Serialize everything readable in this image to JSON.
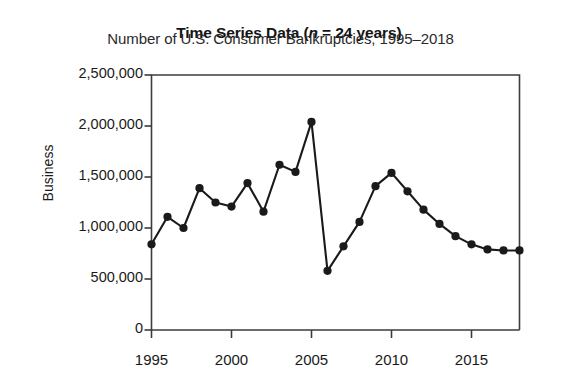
{
  "chart_data": {
    "type": "line",
    "title": "Time Series Data (n = 24 years)",
    "title_prefix": "Time Series Data (",
    "title_italic": "n",
    "title_suffix": " = 24 years)",
    "subtitle": "Number of U.S. Consumer Bankruptcies, 1995–2018",
    "xlabel": "",
    "ylabel": "Business",
    "x": [
      1995,
      1996,
      1997,
      1998,
      1999,
      2000,
      2001,
      2002,
      2003,
      2004,
      2005,
      2006,
      2007,
      2008,
      2009,
      2010,
      2011,
      2012,
      2013,
      2014,
      2015,
      2016,
      2017,
      2018
    ],
    "values": [
      840000,
      1110000,
      1000000,
      1390000,
      1250000,
      1210000,
      1440000,
      1160000,
      1620000,
      1550000,
      2040000,
      580000,
      820000,
      1060000,
      1410000,
      1540000,
      1360000,
      1180000,
      1040000,
      920000,
      840000,
      790000,
      780000,
      780000
    ],
    "categories": [
      "1995",
      "1996",
      "1997",
      "1998",
      "1999",
      "2000",
      "2001",
      "2002",
      "2003",
      "2004",
      "2005",
      "2006",
      "2007",
      "2008",
      "2009",
      "2010",
      "2011",
      "2012",
      "2013",
      "2014",
      "2015",
      "2016",
      "2017",
      "2018"
    ],
    "xlim": [
      1995,
      2018
    ],
    "ylim": [
      0,
      2500000
    ],
    "yticks": [
      0,
      500000,
      1000000,
      1500000,
      2000000,
      2500000
    ],
    "ytick_labels": [
      "0",
      "500,000",
      "1,000,000",
      "1,500,000",
      "2,000,000",
      "2,500,000"
    ],
    "xticks": [
      1995,
      2000,
      2005,
      2010,
      2015
    ],
    "xtick_labels": [
      "1995",
      "2000",
      "2005",
      "2010",
      "2015"
    ],
    "grid": false,
    "legend": null,
    "line_color": "#1a1a1a",
    "marker_color": "#1a1a1a",
    "marker": "circle",
    "axis_color": "#3c3c3c",
    "background": "#ffffff"
  }
}
